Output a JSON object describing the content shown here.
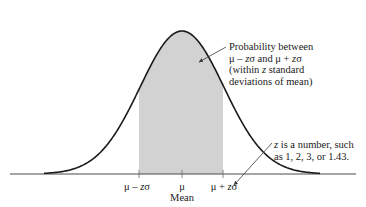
{
  "colors": {
    "curve": "#1a1a1a",
    "shade": "#d2d2d2",
    "axis": "#4a4a4a",
    "arrow": "#3a3a3a",
    "text": "#1a1a1a"
  },
  "annotation_top": {
    "line1": "Probability between",
    "line2_a": "μ – ",
    "line2_z1": "z",
    "line2_b": "σ and μ + ",
    "line2_z2": "z",
    "line2_c": "σ",
    "line3_a": "(within ",
    "line3_z": "z",
    "line3_b": " standard",
    "line4": "deviations of mean)"
  },
  "annotation_bottom": {
    "line1_z": "z",
    "line1_rest": " is a number, such",
    "line2": "as 1, 2, 3, or 1.43."
  },
  "axis": {
    "ticks": [
      {
        "prefix": "μ – ",
        "z": "z",
        "suffix": "σ"
      },
      {
        "prefix": "μ",
        "z": "",
        "suffix": ""
      },
      {
        "prefix": "μ + ",
        "z": "z",
        "suffix": "σ"
      }
    ],
    "mean_label": "Mean"
  }
}
